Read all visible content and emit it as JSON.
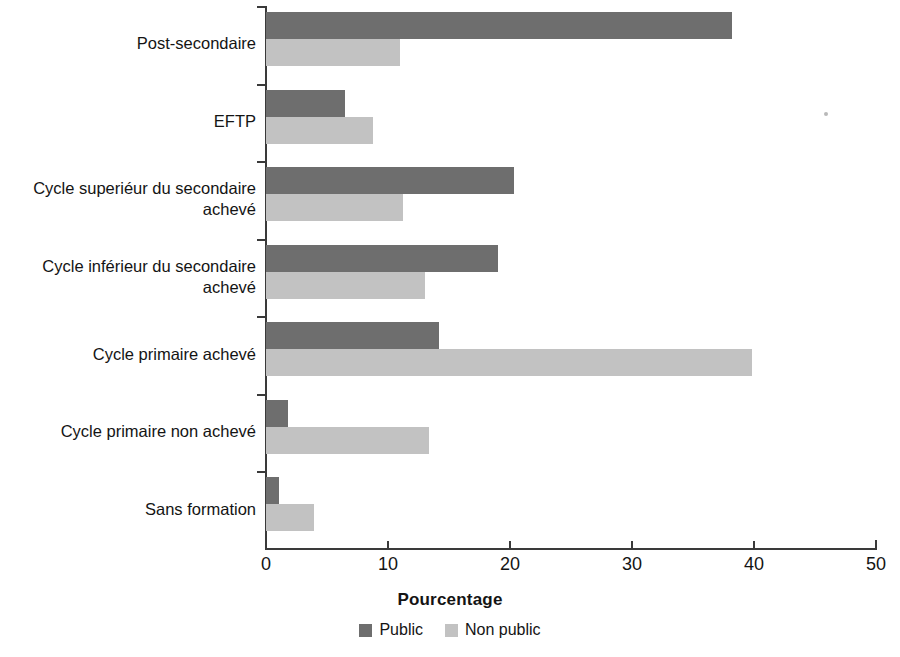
{
  "chart_data": {
    "type": "bar",
    "orientation": "horizontal",
    "title": "",
    "xlabel": "Pourcentage",
    "ylabel": "",
    "xlim": [
      0,
      50
    ],
    "xticks": [
      0,
      10,
      20,
      30,
      40,
      50
    ],
    "xtick_labels": [
      "0",
      "10",
      "20",
      "30",
      "40",
      "50"
    ],
    "grid": false,
    "legend_position": "bottom-center",
    "categories": [
      "Post-secondaire",
      "EFTP",
      "Cycle superiéur du secondaire\nachevé",
      "Cycle inférieur du secondaire\nachevé",
      "Cycle primaire achevé",
      "Cycle primaire non achevé",
      "Sans formation"
    ],
    "series": [
      {
        "name": "Public",
        "color": "#6e6e6e",
        "values": [
          38.2,
          6.5,
          20.3,
          19.0,
          14.2,
          1.8,
          1.1
        ]
      },
      {
        "name": "Non public",
        "color": "#c2c2c2",
        "values": [
          11.0,
          8.8,
          11.2,
          13.0,
          39.8,
          13.4,
          3.9
        ]
      }
    ]
  },
  "legend": {
    "items": [
      {
        "label": "Public",
        "color": "#6e6e6e"
      },
      {
        "label": "Non public",
        "color": "#c2c2c2"
      }
    ]
  },
  "axis": {
    "x_title": "Pourcentage"
  }
}
